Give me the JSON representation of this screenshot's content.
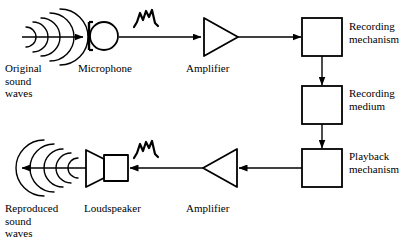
{
  "figure": {
    "background_color": "#ffffff",
    "stroke_color": "#000000"
  },
  "labels": {
    "original_sound_waves": "Original\nsound\nwaves",
    "microphone": "Microphone",
    "amplifier_top": "Amplifier",
    "recording_mechanism": "Recording\nmechanism",
    "recording_medium": "Recording\nmedium",
    "playback_mechanism": "Playback\nmechanism",
    "reproduced_sound_waves": "Reproduced\nsound\nwaves",
    "loudspeaker": "Loudspeaker",
    "amplifier_bottom": "Amplifier"
  },
  "nodes": [
    {
      "id": "original-sound-waves",
      "type": "sound-waves",
      "direction": "right",
      "arcs": 5
    },
    {
      "id": "microphone",
      "type": "microphone-symbol"
    },
    {
      "id": "amplifier-top",
      "type": "amplifier-triangle",
      "direction": "right"
    },
    {
      "id": "recording-mechanism",
      "type": "box"
    },
    {
      "id": "recording-medium",
      "type": "box"
    },
    {
      "id": "playback-mechanism",
      "type": "box"
    },
    {
      "id": "amplifier-bottom",
      "type": "amplifier-triangle",
      "direction": "left"
    },
    {
      "id": "loudspeaker",
      "type": "loudspeaker-symbol"
    },
    {
      "id": "reproduced-sound-waves",
      "type": "sound-waves",
      "direction": "left",
      "arcs": 5
    }
  ],
  "signal_waveforms": [
    {
      "id": "waveform-top",
      "above": "microphone-to-amplifier-link"
    },
    {
      "id": "waveform-bottom",
      "above": "amplifier-to-loudspeaker-link"
    }
  ],
  "connections": [
    {
      "id": "waves-to-microphone",
      "from": "original-sound-waves",
      "to": "microphone",
      "direction": "right"
    },
    {
      "id": "microphone-to-amplifier",
      "from": "microphone",
      "to": "amplifier-top",
      "direction": "right"
    },
    {
      "id": "amplifier-to-recording",
      "from": "amplifier-top",
      "to": "recording-mechanism",
      "direction": "right"
    },
    {
      "id": "recording-to-medium",
      "from": "recording-mechanism",
      "to": "recording-medium",
      "direction": "down"
    },
    {
      "id": "medium-to-playback",
      "from": "recording-medium",
      "to": "playback-mechanism",
      "direction": "down"
    },
    {
      "id": "playback-to-amplifier",
      "from": "playback-mechanism",
      "to": "amplifier-bottom",
      "direction": "left"
    },
    {
      "id": "amplifier-to-loudspeaker",
      "from": "amplifier-bottom",
      "to": "loudspeaker",
      "direction": "left"
    },
    {
      "id": "loudspeaker-to-waves",
      "from": "loudspeaker",
      "to": "reproduced-sound-waves",
      "direction": "left"
    }
  ]
}
